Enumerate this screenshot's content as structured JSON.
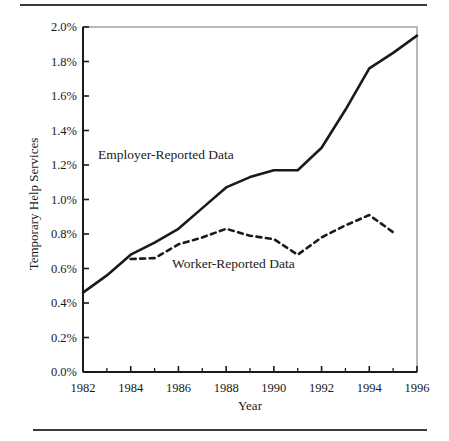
{
  "figure": {
    "background": "#ffffff",
    "ink_color": "#1a1a1a",
    "rule_color": "#3a3a3a"
  },
  "axis": {
    "y_title": "Temporary Help Services",
    "x_title": "Year",
    "y_ticks": [
      "0.0%",
      "0.2%",
      "0.4%",
      "0.6%",
      "0.8%",
      "1.0%",
      "1.2%",
      "1.4%",
      "1.6%",
      "1.8%",
      "2.0%"
    ],
    "x_ticks": [
      "1982",
      "1984",
      "1986",
      "1988",
      "1990",
      "1992",
      "1994",
      "1996"
    ],
    "x_minor_ticks": [
      "1983",
      "1985",
      "1987",
      "1989",
      "1991",
      "1993",
      "1995"
    ]
  },
  "annotations": {
    "employer": "Employer-Reported Data",
    "worker": "Worker-Reported Data"
  },
  "chart_data": {
    "type": "line",
    "title": "",
    "subtitle": "",
    "xlabel": "Year",
    "ylabel": "Temporary Help Services",
    "xlim": [
      1982,
      1996
    ],
    "ylim": [
      0.0,
      2.0
    ],
    "y_unit": "percent",
    "y_tick_step": 0.2,
    "x_tick_step": 2,
    "x_minor_tick_step": 1,
    "grid": false,
    "legend": "inline-annotations",
    "x": [
      1982,
      1983,
      1984,
      1985,
      1986,
      1987,
      1988,
      1989,
      1990,
      1991,
      1992,
      1993,
      1994,
      1995,
      1996
    ],
    "series": [
      {
        "name": "Employer-Reported Data",
        "style": "solid",
        "color": "#1a1a1a",
        "width": 2.6,
        "values": [
          0.46,
          0.56,
          0.68,
          0.75,
          0.83,
          0.95,
          1.07,
          1.13,
          1.17,
          1.17,
          1.3,
          1.52,
          1.76,
          1.85,
          1.95
        ]
      },
      {
        "name": "Worker-Reported Data",
        "style": "dashed",
        "color": "#1a1a1a",
        "width": 2.6,
        "values": [
          null,
          null,
          0.655,
          0.66,
          0.74,
          0.78,
          0.83,
          0.79,
          0.77,
          0.68,
          0.78,
          0.85,
          0.91,
          0.81,
          null
        ]
      }
    ]
  }
}
